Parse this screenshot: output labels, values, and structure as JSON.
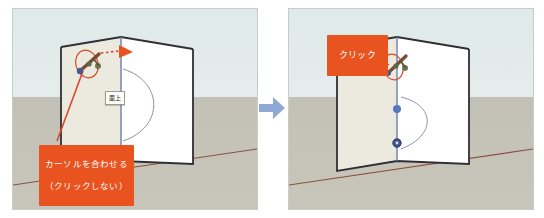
{
  "figure": {
    "transition_arrow": "arrow-right",
    "colors": {
      "callout_bg": "#e8531f",
      "callout_text": "#ffffff",
      "sky": "#e1eae8",
      "ground": "#c5c3b8",
      "box_face_shaded": "#eceadf",
      "box_face_lit": "#ffffff",
      "edge_dark": "#2f3036",
      "edge_blue": "#6b7fb5",
      "inference_red": "#d94a2b",
      "inference_blue": "#5577bb",
      "ground_axis_red": "#8c5040",
      "arrow_blue": "#8fa9d6"
    }
  },
  "panels": [
    {
      "id": "step-1",
      "name": "hover-step",
      "callout": {
        "label": "カーソルを合わせる\n（クリックしない）",
        "line1": "カーソルを合わせる",
        "line2": "（クリックしない）"
      },
      "tooltip": {
        "label": "面上"
      },
      "cursor": {
        "name": "push-pull-cursor",
        "highlight": "red-ellipse",
        "direction_arrow": "dashed-arrow-right"
      },
      "annotations": {
        "arc": "arc-on-right-face",
        "ground_axis": "red-axis-line"
      }
    },
    {
      "id": "step-2",
      "name": "click-step",
      "callout": {
        "label": "クリック",
        "line1": "クリック",
        "line2": ""
      },
      "tooltip": {
        "label": "端点"
      },
      "cursor": {
        "name": "push-pull-cursor",
        "highlight": "red-ellipse",
        "direction_arrow": "none"
      },
      "annotations": {
        "midpoint_dot": "blue-midpoint",
        "endpoint_dot": "blue-endpoint",
        "arc": "arc-curve",
        "ground_axis": "red-axis-line"
      }
    }
  ]
}
